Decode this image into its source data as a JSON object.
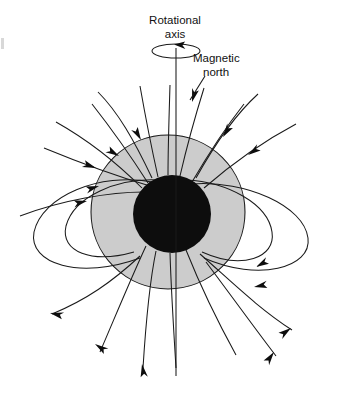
{
  "figure": {
    "type": "diagram",
    "background_color": "#ffffff",
    "line_color": "#1a1a1a",
    "mantle_color": "#cccccc",
    "core_color": "#0d0d0d"
  },
  "labels": {
    "rotational_axis_line1": "Rotational",
    "rotational_axis_line2": "axis",
    "magnetic_north_line1": "Magnetic",
    "magnetic_north_line2": "north"
  },
  "geometry": {
    "mantle_center_x": 168,
    "mantle_center_y": 212,
    "mantle_radius": 77,
    "core_center_x": 172,
    "core_center_y": 214,
    "core_radius": 39,
    "rotation_axis_x": 176,
    "rotation_axis_top_y": 48,
    "rotation_axis_bottom_y": 376,
    "spin_ellipse_cx": 176,
    "spin_ellipse_cy": 51,
    "spin_ellipse_rx": 24,
    "spin_ellipse_ry": 7,
    "magnetic_axis_tilt_degrees": 12
  },
  "annotations": {
    "field_direction_top": "inward",
    "field_direction_bottom": "outward",
    "spin_direction": "counterclockwise"
  }
}
